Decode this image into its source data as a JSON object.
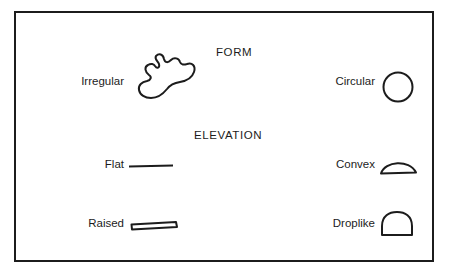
{
  "figure": {
    "border_color": "#1c1c1c",
    "ink_color": "#1c1c1c",
    "background_color": "#ffffff",
    "sections": [
      {
        "heading": "FORM",
        "rows": [
          {
            "label": "Irregular",
            "icon": "irregular-blob-icon"
          },
          {
            "label": "Circular",
            "icon": "circle-outline-icon"
          }
        ]
      },
      {
        "heading": "ELEVATION",
        "rows": [
          {
            "label": "Flat",
            "icon": "flat-line-icon"
          },
          {
            "label": "Convex",
            "icon": "convex-dome-icon"
          },
          {
            "label": "Raised",
            "icon": "raised-slab-icon"
          },
          {
            "label": "Droplike",
            "icon": "droplike-dome-icon"
          }
        ]
      }
    ]
  }
}
